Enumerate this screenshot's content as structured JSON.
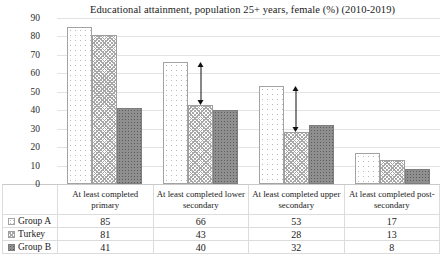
{
  "chart_data": {
    "type": "bar",
    "title": "Educational attainment, population 25+ years, female (%) (2010-2019)",
    "categories": [
      "At least completed primary",
      "At least completed lower secondary",
      "At least completed upper secondary",
      "At least completed post-secondary"
    ],
    "series": [
      {
        "name": "Group A",
        "values": [
          85,
          66,
          53,
          17
        ],
        "pattern": "light-dots",
        "fill": "#ffffff"
      },
      {
        "name": "Turkey",
        "values": [
          81,
          43,
          28,
          13
        ],
        "pattern": "crosshatch",
        "fill": "#c9c9c9"
      },
      {
        "name": "Group B",
        "values": [
          41,
          40,
          32,
          8
        ],
        "pattern": "dark-dots",
        "fill": "#8f8f8f"
      }
    ],
    "ylim": [
      0,
      90
    ],
    "yticks": [
      0,
      10,
      20,
      30,
      40,
      50,
      60,
      70,
      80,
      90
    ],
    "grid": true,
    "legend_position": "data-table-left",
    "annotations": [
      {
        "type": "double-arrow",
        "category_index": 1,
        "from_value": 66,
        "to_value": 43
      },
      {
        "type": "double-arrow",
        "category_index": 2,
        "from_value": 53,
        "to_value": 28
      }
    ],
    "colors": {
      "gridline": "#e3e3e3",
      "axis_line": "#c9c9c9",
      "arrow": "#111111",
      "text": "#1a1a1a"
    }
  }
}
